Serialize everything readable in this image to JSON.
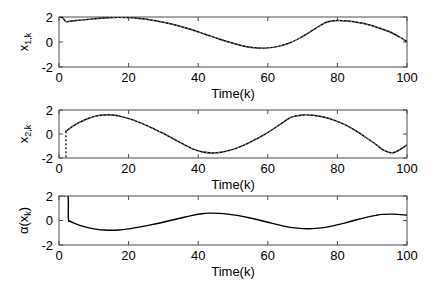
{
  "figure": {
    "background_color": "#ffffff",
    "line_color": "#000000",
    "axis_color": "#4d4d4d",
    "width": 440,
    "height": 286
  },
  "chart_data": [
    {
      "type": "line",
      "index": 0,
      "title": "",
      "xlabel": "Time(k)",
      "ylabel": "x_{1,k}",
      "ylabel_base": "x",
      "ylabel_subscript": "1,k",
      "xlim": [
        0,
        100
      ],
      "ylim": [
        -2,
        2
      ],
      "xticks": [
        0,
        20,
        40,
        60,
        80,
        100
      ],
      "xtick_labels": [
        "0",
        "20",
        "40",
        "60",
        "80",
        "100"
      ],
      "yticks": [
        -2,
        0,
        2
      ],
      "ytick_labels": [
        "-2",
        "0",
        "2"
      ],
      "grid": false,
      "legend": null,
      "series": [
        {
          "name": "x1",
          "style": "solid-with-dashed-overlay",
          "x": [
            0,
            1,
            2,
            3,
            5,
            8,
            11,
            14,
            17,
            20,
            23,
            26,
            30,
            34,
            38,
            42,
            46,
            50,
            54,
            57,
            60,
            63,
            66,
            69,
            72,
            75,
            77,
            80,
            83,
            86,
            89,
            92,
            95,
            98,
            100
          ],
          "y": [
            2.0,
            1.95,
            1.62,
            1.66,
            1.72,
            1.8,
            1.88,
            1.94,
            1.97,
            1.95,
            1.88,
            1.78,
            1.58,
            1.32,
            1.0,
            0.62,
            0.24,
            -0.1,
            -0.38,
            -0.48,
            -0.47,
            -0.35,
            -0.1,
            0.28,
            0.78,
            1.3,
            1.6,
            1.72,
            1.68,
            1.56,
            1.38,
            1.12,
            0.82,
            0.38,
            0.02
          ]
        }
      ]
    },
    {
      "type": "line",
      "index": 1,
      "title": "",
      "xlabel": "Time(k)",
      "ylabel": "x_{2,k}",
      "ylabel_base": "x",
      "ylabel_subscript": "2,k",
      "xlim": [
        0,
        100
      ],
      "ylim": [
        -2,
        2
      ],
      "xticks": [
        0,
        20,
        40,
        60,
        80,
        100
      ],
      "xtick_labels": [
        "0",
        "20",
        "40",
        "60",
        "80",
        "100"
      ],
      "yticks": [
        -2,
        0,
        2
      ],
      "ytick_labels": [
        "-2",
        "0",
        "2"
      ],
      "grid": false,
      "legend": null,
      "series": [
        {
          "name": "x2",
          "style": "solid-with-dashed-overlay",
          "x": [
            2,
            3,
            4,
            6,
            8,
            10,
            12,
            14,
            16,
            18,
            21,
            24,
            27,
            30,
            33,
            36,
            39,
            41,
            44,
            47,
            50,
            53,
            56,
            59,
            62,
            65,
            67,
            70,
            73,
            76,
            79,
            82,
            85,
            88,
            91,
            93,
            96,
            100
          ],
          "y": [
            0.22,
            0.45,
            0.65,
            0.98,
            1.25,
            1.45,
            1.56,
            1.6,
            1.56,
            1.45,
            1.2,
            0.86,
            0.46,
            0.05,
            -0.42,
            -0.88,
            -1.3,
            -1.48,
            -1.58,
            -1.5,
            -1.28,
            -0.95,
            -0.52,
            -0.05,
            0.5,
            1.1,
            1.42,
            1.58,
            1.56,
            1.42,
            1.16,
            0.8,
            0.32,
            -0.25,
            -0.85,
            -1.3,
            -1.56,
            -0.92
          ]
        },
        {
          "name": "initial-drop",
          "style": "dashed-vertical",
          "x": [
            2,
            2
          ],
          "y": [
            0.22,
            -2.0
          ]
        }
      ]
    },
    {
      "type": "line",
      "index": 2,
      "title": "",
      "xlabel": "Time(k)",
      "ylabel": "alpha(x_k)",
      "ylabel_base": "α(x",
      "ylabel_subscript": "k",
      "ylabel_tail": ")",
      "xlim": [
        0,
        100
      ],
      "ylim": [
        -2,
        2
      ],
      "xticks": [
        0,
        20,
        40,
        60,
        80,
        100
      ],
      "xtick_labels": [
        "0",
        "20",
        "40",
        "60",
        "80",
        "100"
      ],
      "yticks": [
        -2,
        0,
        2
      ],
      "ytick_labels": [
        "-2",
        "0",
        "2"
      ],
      "grid": false,
      "legend": null,
      "series": [
        {
          "name": "alpha",
          "style": "solid",
          "x": [
            1.5,
            2.6,
            2.7,
            3.2,
            4,
            5,
            7,
            9,
            11,
            13,
            15,
            17,
            20,
            23,
            26,
            29,
            32,
            35,
            38,
            41,
            43,
            46,
            49,
            52,
            55,
            58,
            61,
            64,
            67,
            70,
            73,
            76,
            79,
            82,
            85,
            88,
            91,
            93,
            96,
            100
          ],
          "y": [
            2.0,
            2.0,
            0.1,
            -0.05,
            -0.18,
            -0.3,
            -0.48,
            -0.62,
            -0.72,
            -0.78,
            -0.8,
            -0.78,
            -0.68,
            -0.54,
            -0.38,
            -0.2,
            0.0,
            0.2,
            0.4,
            0.55,
            0.6,
            0.58,
            0.5,
            0.38,
            0.2,
            0.0,
            -0.22,
            -0.42,
            -0.58,
            -0.66,
            -0.66,
            -0.58,
            -0.42,
            -0.22,
            0.02,
            0.24,
            0.42,
            0.5,
            0.52,
            0.44
          ]
        }
      ]
    }
  ]
}
